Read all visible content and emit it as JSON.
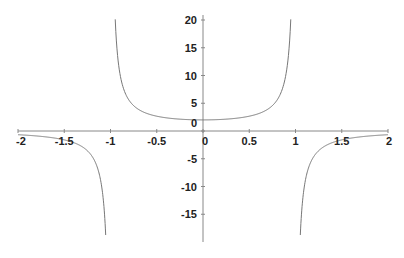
{
  "chart_data": {
    "type": "line",
    "title": "",
    "xlabel": "",
    "ylabel": "",
    "function": "y = 2/(1 - x^2)",
    "xlim": [
      -2,
      2
    ],
    "ylim": [
      -19,
      20.5
    ],
    "grid": false,
    "legend": null,
    "x_ticks": [
      "-2",
      "-1.5",
      "-1",
      "-0.5",
      "0",
      "0.5",
      "1",
      "1.5",
      "2"
    ],
    "y_ticks": [
      "20",
      "15",
      "10",
      "5",
      "0",
      "-5",
      "-10",
      "-15"
    ],
    "vertical_asymptotes": [
      -1,
      1
    ],
    "series": [
      {
        "name": "left branch",
        "x": [
          -2,
          -1.75,
          -1.5,
          -1.3,
          -1.2,
          -1.1,
          -1.05
        ],
        "y": [
          -0.67,
          -0.97,
          -1.6,
          -2.9,
          -4.55,
          -9.52,
          -19.5
        ]
      },
      {
        "name": "middle branch",
        "x": [
          -0.95,
          -0.9,
          -0.8,
          -0.5,
          0,
          0.5,
          0.8,
          0.9,
          0.95
        ],
        "y": [
          20.5,
          10.53,
          5.56,
          2.67,
          2,
          2.67,
          5.56,
          10.53,
          20.5
        ]
      },
      {
        "name": "right branch",
        "x": [
          1.05,
          1.1,
          1.2,
          1.3,
          1.5,
          1.75,
          2
        ],
        "y": [
          -19.5,
          -9.52,
          -4.55,
          -2.9,
          -1.6,
          -0.97,
          -0.67
        ]
      }
    ],
    "colors": {
      "axis": "#888888",
      "curve": "#777777",
      "text": "#222222"
    }
  }
}
